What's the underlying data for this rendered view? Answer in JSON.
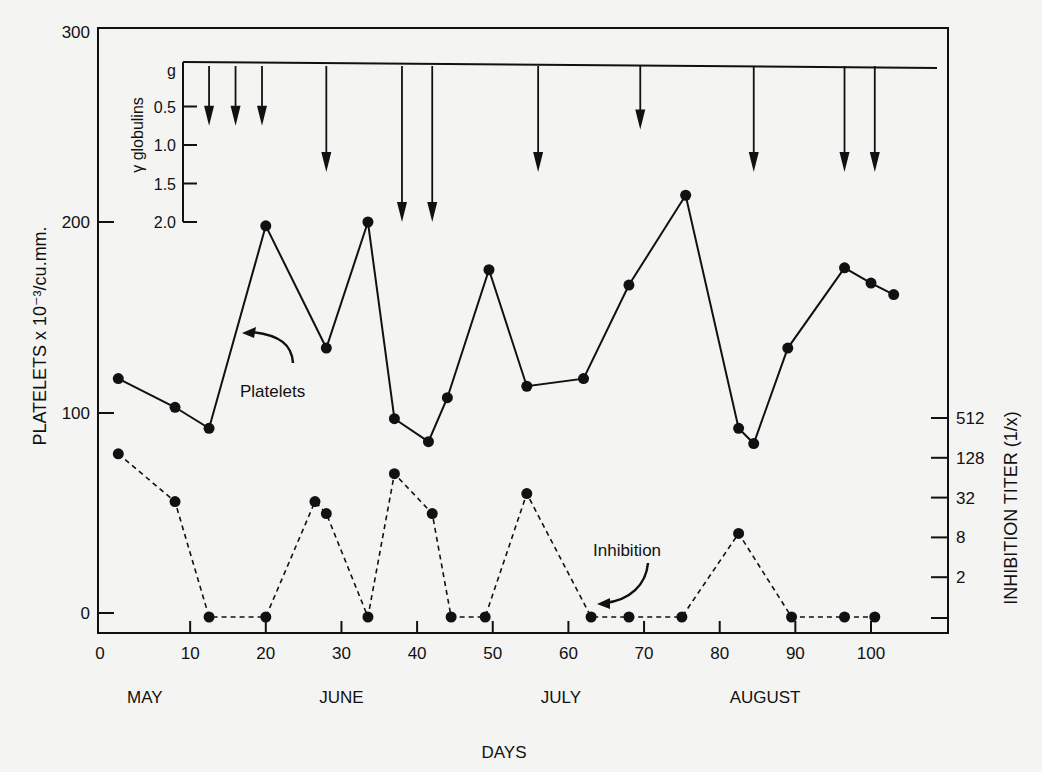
{
  "chart_data": {
    "type": "line",
    "title": "",
    "xlabel": "DAYS",
    "ylabel": "PLATELETS x 10⁻³/cu.mm.",
    "y2label": "INHIBITION TITER (1/x)",
    "inset_label": "γ globulins",
    "xlim": [
      0,
      105
    ],
    "ylim": [
      0,
      300
    ],
    "grid": false,
    "x_ticks": [
      0,
      10,
      20,
      30,
      40,
      50,
      60,
      70,
      80,
      90,
      100
    ],
    "y_ticks": [
      0,
      100,
      200,
      300
    ],
    "y2_ticks": [
      "",
      "2",
      "8",
      "32",
      "128",
      "512"
    ],
    "inset_ticks": [
      "g",
      "0.5",
      "1.0",
      "1.5",
      "2.0"
    ],
    "month_labels": [
      {
        "label": "MAY",
        "day": 4
      },
      {
        "label": "JUNE",
        "day": 30
      },
      {
        "label": "JULY",
        "day": 59
      },
      {
        "label": "AUGUST",
        "day": 86
      }
    ],
    "series": [
      {
        "name": "Platelets",
        "style": "solid",
        "x": [
          0.5,
          8,
          12.5,
          20,
          28,
          33.5,
          37,
          41.5,
          44,
          49.5,
          54.5,
          62,
          68,
          75.5,
          82.5,
          84.5,
          89,
          96.5,
          100,
          103
        ],
        "values": [
          118,
          103,
          92,
          198,
          134,
          200,
          97,
          85,
          108,
          175,
          114,
          118,
          167,
          214,
          92,
          84,
          134,
          176,
          168,
          162
        ]
      },
      {
        "name": "Inhibition",
        "style": "dashed",
        "x": [
          0.5,
          8,
          12.5,
          20,
          26.5,
          28,
          33.5,
          37,
          42,
          44.5,
          49,
          54.5,
          63,
          68,
          75,
          82.5,
          89.5,
          96.5,
          100.5
        ],
        "titer_level": [
          4.1,
          2.9,
          0,
          0,
          2.9,
          2.6,
          0,
          3.6,
          2.6,
          0,
          0,
          3.1,
          0,
          0,
          0,
          2.1,
          0,
          0,
          0
        ]
      },
      {
        "name": "γ globulins (g)",
        "style": "arrows",
        "x": [
          12.5,
          16,
          19.5,
          28,
          38,
          42,
          56,
          69.5,
          84.5,
          96.5,
          100.5
        ],
        "values": [
          0.75,
          0.75,
          0.75,
          1.35,
          2.0,
          2.0,
          1.35,
          0.8,
          1.35,
          1.35,
          1.35
        ]
      }
    ],
    "annotations": [
      {
        "text": "Platelets",
        "points_to": "platelet line near day 19"
      },
      {
        "text": "Inhibition",
        "points_to": "inhibition line near day 63"
      }
    ]
  },
  "labels": {
    "xlabel": "DAYS",
    "ylabel": "PLATELETS x 10⁻³/cu.mm.",
    "y2label": "INHIBITION TITER (1/x)",
    "inset_label": "γ globulins",
    "platelets_annotation": "Platelets",
    "inhibition_annotation": "Inhibition"
  }
}
